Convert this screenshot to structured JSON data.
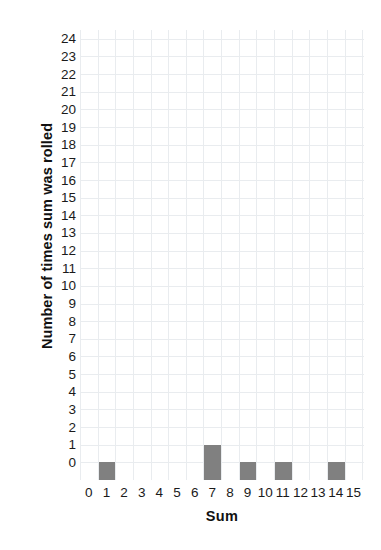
{
  "chart_data": {
    "type": "bar",
    "title": "",
    "xlabel": "Sum",
    "ylabel": "Number of times sum was rolled",
    "categories": [
      0,
      1,
      2,
      3,
      4,
      5,
      6,
      7,
      8,
      9,
      10,
      11,
      12,
      13,
      14,
      15
    ],
    "values": [
      0,
      1,
      0,
      0,
      0,
      0,
      0,
      2,
      0,
      1,
      0,
      1,
      0,
      0,
      1,
      0
    ],
    "bar_baseline": -1,
    "bars": [
      {
        "x": 1,
        "top": 0,
        "bottom": -1
      },
      {
        "x": 7,
        "top": 1,
        "bottom": -1
      },
      {
        "x": 9,
        "top": 0,
        "bottom": -1
      },
      {
        "x": 11,
        "top": 0,
        "bottom": -1
      },
      {
        "x": 14,
        "top": 0,
        "bottom": -1
      }
    ],
    "xlim": [
      -0.5,
      15.5
    ],
    "ylim": [
      -1,
      24.5
    ],
    "x_tick_labels": [
      "0",
      "1",
      "2",
      "3",
      "4",
      "5",
      "6",
      "7",
      "8",
      "9",
      "10",
      "11",
      "12",
      "13",
      "14",
      "15"
    ],
    "y_tick_labels": [
      "24",
      "23",
      "22",
      "21",
      "20",
      "19",
      "18",
      "17",
      "16",
      "15",
      "14",
      "13",
      "12",
      "11",
      "10",
      "9",
      "8",
      "7",
      "6",
      "5",
      "4",
      "3",
      "2",
      "1",
      "0"
    ],
    "grid": true,
    "legend": null,
    "colors": {
      "bar": "#808080",
      "gridline": "#e9ecef",
      "background": "#ffffff",
      "text": "#1a1a1a"
    }
  }
}
